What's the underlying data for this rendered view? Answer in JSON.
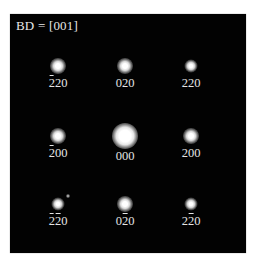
{
  "figure": {
    "zone_label": "BD = [001]",
    "background_color": "#020202",
    "spot_color": "#ffffff",
    "label_color": "#e4e4e4"
  },
  "spots": [
    {
      "id": "m220",
      "x": 48,
      "y": 52,
      "size": "normal",
      "label": "220",
      "bars": [
        true,
        false,
        false
      ]
    },
    {
      "id": "020",
      "x": 115,
      "y": 52,
      "size": "normal",
      "label": "020",
      "bars": [
        false,
        false,
        false
      ]
    },
    {
      "id": "220",
      "x": 181,
      "y": 52,
      "size": "small",
      "label": "220",
      "bars": [
        false,
        false,
        false
      ]
    },
    {
      "id": "m200",
      "x": 48,
      "y": 122,
      "size": "normal",
      "label": "200",
      "bars": [
        true,
        false,
        false
      ]
    },
    {
      "id": "000",
      "x": 115,
      "y": 122,
      "size": "center",
      "label": "000",
      "bars": [
        false,
        false,
        false
      ]
    },
    {
      "id": "200",
      "x": 181,
      "y": 122,
      "size": "normal",
      "label": "200",
      "bars": [
        false,
        false,
        false
      ]
    },
    {
      "id": "m2m20",
      "x": 48,
      "y": 190,
      "size": "small",
      "label": "220",
      "bars": [
        true,
        true,
        false
      ]
    },
    {
      "id": "0m20",
      "x": 115,
      "y": 190,
      "size": "normal",
      "label": "020",
      "bars": [
        false,
        true,
        false
      ]
    },
    {
      "id": "2m20",
      "x": 181,
      "y": 190,
      "size": "small",
      "label": "220",
      "bars": [
        false,
        true,
        false
      ]
    }
  ],
  "labels": {
    "r0c0": "2̄20",
    "r0c1": "020",
    "r0c2": "220",
    "r1c0": "2̄00",
    "r1c1": "000",
    "r1c2": "200",
    "r2c0": "2̄2̄0",
    "r2c1": "02̄0",
    "r2c2": "22̄0"
  },
  "stray_dots": [
    {
      "x": 58,
      "y": 182
    }
  ]
}
